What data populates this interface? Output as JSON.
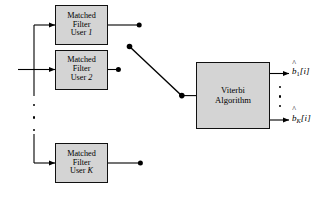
{
  "diagram": {
    "background_color": "#ffffff",
    "line_color": "#000000",
    "block_fill_color": "#d4d4d4",
    "block_border_color": "#111111",
    "matched_filters": [
      {
        "id": "matched-filter-user-1",
        "line1": "Matched",
        "line2": "Filter",
        "line3_prefix": "User ",
        "line3_index": "1"
      },
      {
        "id": "matched-filter-user-2",
        "line1": "Matched",
        "line2": "Filter",
        "line3_prefix": "User ",
        "line3_index": "2"
      },
      {
        "id": "matched-filter-user-k",
        "line1": "Matched",
        "line2": "Filter",
        "line3_prefix": "User ",
        "line3_index": "K"
      }
    ],
    "detector": {
      "id": "viterbi-algorithm",
      "line1": "Viterbi",
      "line2": "Algorithm"
    },
    "switch": {
      "id": "commutator-switch",
      "label": ""
    },
    "outputs": [
      {
        "id": "output-b-hat-1",
        "hat": "^",
        "base": "b",
        "subscript": "1",
        "subscript_italic": false,
        "bracket": "[i]"
      },
      {
        "id": "output-b-hat-k",
        "hat": "^",
        "base": "b",
        "subscript": "K",
        "subscript_italic": true,
        "bracket": "[i]"
      }
    ],
    "ellipsis": {
      "input_bus_dots": 3,
      "output_dots": 3
    }
  }
}
